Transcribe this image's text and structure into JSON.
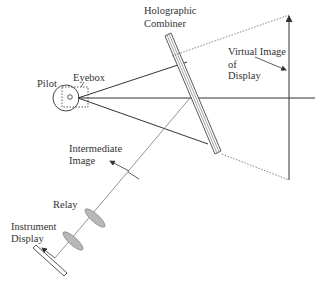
{
  "diagram": {
    "labels": {
      "pilot": "Pilot",
      "eyebox": "Eyebox",
      "combiner_line1": "Holographic",
      "combiner_line2": "Combiner",
      "virtual_line1": "Virtual Image",
      "virtual_line2": "of",
      "virtual_line3": "Display",
      "intermediate_line1": "Intermediate",
      "intermediate_line2": "Image",
      "relay": "Relay",
      "instrument_line1": "Instrument",
      "instrument_line2": "Display"
    },
    "colors": {
      "line": "#333333",
      "lens_fill": "#b8b8b8",
      "dashed": "#666666"
    }
  }
}
